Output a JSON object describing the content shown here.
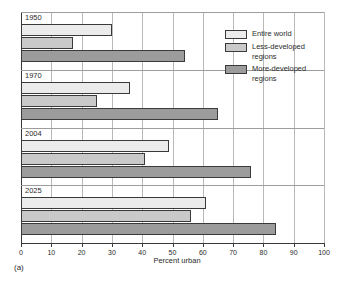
{
  "chart_data": {
    "type": "bar",
    "orientation": "horizontal",
    "title": "",
    "xlabel": "Percent urban",
    "ylabel": "",
    "xlim": [
      0,
      100
    ],
    "xticks": [
      0,
      10,
      20,
      30,
      40,
      50,
      60,
      70,
      80,
      90,
      100
    ],
    "grid": true,
    "legend_position": "top-right",
    "categories": [
      "1950",
      "1970",
      "2004",
      "2025"
    ],
    "series": [
      {
        "name": "Entire world",
        "color": "#ebebeb",
        "values": [
          30,
          36,
          49,
          61
        ]
      },
      {
        "name": "Less-developed regions",
        "color": "#c9c9c9",
        "values": [
          17,
          25,
          41,
          56
        ]
      },
      {
        "name": "More-developed regions",
        "color": "#9c9c9c",
        "values": [
          54,
          65,
          76,
          84
        ]
      }
    ],
    "legend_entries": [
      "Entire world",
      "Less-developed\nregions",
      "More-developed\nregions"
    ]
  },
  "axis": {
    "xlabel": "Percent urban",
    "tick_labels": [
      "0",
      "10",
      "20",
      "30",
      "40",
      "50",
      "60",
      "70",
      "80",
      "90",
      "100"
    ]
  },
  "groups": [
    {
      "label": "1950"
    },
    {
      "label": "1970"
    },
    {
      "label": "2004"
    },
    {
      "label": "2025"
    }
  ],
  "legend": {
    "items": [
      {
        "label": "Entire world"
      },
      {
        "label": "Less-developed\nregions"
      },
      {
        "label": "More-developed\nregions"
      }
    ]
  },
  "caption": {
    "text": "(a)"
  },
  "colors": {
    "series_entire_world": "#ebebeb",
    "series_less_developed": "#c9c9c9",
    "series_more_developed": "#9c9c9c",
    "axis": "#3a3a3a",
    "grid": "#b9b9b9"
  }
}
